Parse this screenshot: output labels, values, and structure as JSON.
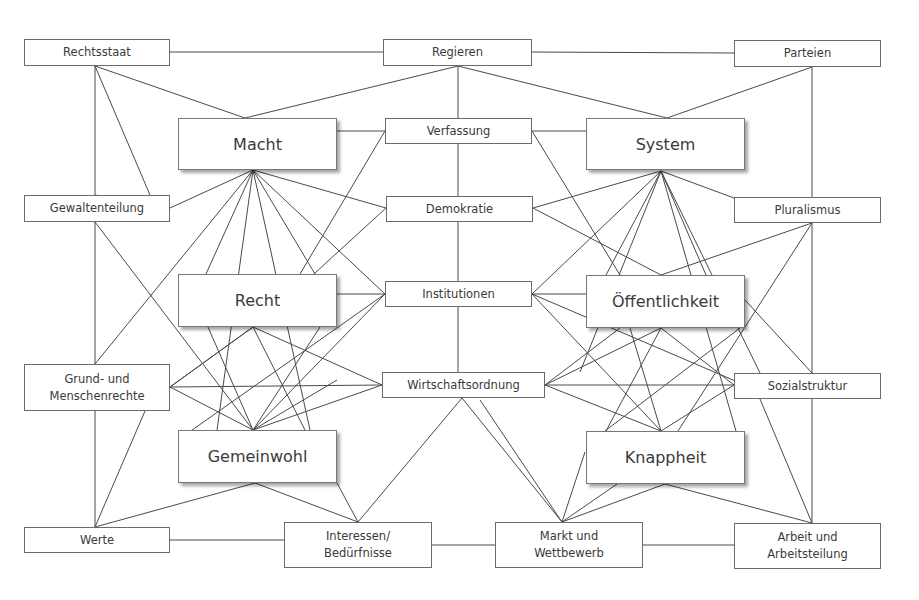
{
  "diagram": {
    "type": "concept-map",
    "nodes": [
      {
        "id": "rechtsstaat",
        "label": "Rechtsstaat",
        "kind": "small",
        "x": 24,
        "y": 39,
        "w": 146,
        "h": 27
      },
      {
        "id": "regieren",
        "label": "Regieren",
        "kind": "small",
        "x": 383,
        "y": 39,
        "w": 149,
        "h": 27
      },
      {
        "id": "parteien",
        "label": "Parteien",
        "kind": "small",
        "x": 734,
        "y": 40,
        "w": 147,
        "h": 27
      },
      {
        "id": "macht",
        "label": "Macht",
        "kind": "major",
        "x": 178,
        "y": 118,
        "w": 159,
        "h": 52
      },
      {
        "id": "verfassung",
        "label": "Verfassung",
        "kind": "small",
        "x": 385,
        "y": 118,
        "w": 147,
        "h": 26
      },
      {
        "id": "system",
        "label": "System",
        "kind": "major",
        "x": 586,
        "y": 118,
        "w": 159,
        "h": 52
      },
      {
        "id": "gewaltenteilung",
        "label": "Gewaltenteilung",
        "kind": "small",
        "x": 24,
        "y": 195,
        "w": 146,
        "h": 27
      },
      {
        "id": "demokratie",
        "label": "Demokratie",
        "kind": "small",
        "x": 386,
        "y": 196,
        "w": 147,
        "h": 26
      },
      {
        "id": "pluralismus",
        "label": "Pluralismus",
        "kind": "small",
        "x": 734,
        "y": 197,
        "w": 147,
        "h": 26
      },
      {
        "id": "recht",
        "label": "Recht",
        "kind": "major",
        "x": 178,
        "y": 274,
        "w": 159,
        "h": 53
      },
      {
        "id": "institutionen",
        "label": "Institutionen",
        "kind": "small",
        "x": 385,
        "y": 281,
        "w": 147,
        "h": 26
      },
      {
        "id": "oeffentlichkeit",
        "label": "Öffentlichkeit",
        "kind": "major",
        "x": 586,
        "y": 275,
        "w": 159,
        "h": 53
      },
      {
        "id": "grundrechte",
        "label": "Grund- und\nMenschenrechte",
        "kind": "small",
        "x": 24,
        "y": 364,
        "w": 146,
        "h": 47
      },
      {
        "id": "wirtschaftsordnung",
        "label": "Wirtschaftsordnung",
        "kind": "small",
        "x": 382,
        "y": 372,
        "w": 163,
        "h": 26
      },
      {
        "id": "sozialstruktur",
        "label": "Sozialstruktur",
        "kind": "small",
        "x": 734,
        "y": 373,
        "w": 147,
        "h": 26
      },
      {
        "id": "gemeinwohl",
        "label": "Gemeinwohl",
        "kind": "major",
        "x": 178,
        "y": 430,
        "w": 159,
        "h": 53
      },
      {
        "id": "knappheit",
        "label": "Knappheit",
        "kind": "major",
        "x": 586,
        "y": 431,
        "w": 159,
        "h": 53
      },
      {
        "id": "werte",
        "label": "Werte",
        "kind": "small",
        "x": 24,
        "y": 527,
        "w": 146,
        "h": 26
      },
      {
        "id": "interessen",
        "label": "Interessen/\nBedürfnisse",
        "kind": "small",
        "x": 284,
        "y": 522,
        "w": 148,
        "h": 46
      },
      {
        "id": "markt",
        "label": "Markt und\nWettbewerb",
        "kind": "small",
        "x": 495,
        "y": 522,
        "w": 148,
        "h": 46
      },
      {
        "id": "arbeit",
        "label": "Arbeit und\nArbeitsteilung",
        "kind": "small",
        "x": 734,
        "y": 523,
        "w": 147,
        "h": 46
      }
    ],
    "edges": [
      [
        170,
        52,
        383,
        52
      ],
      [
        532,
        52,
        734,
        53
      ],
      [
        95,
        66,
        95,
        195
      ],
      [
        95,
        66,
        150,
        195
      ],
      [
        95,
        66,
        245,
        118
      ],
      [
        458,
        66,
        245,
        118
      ],
      [
        458,
        66,
        667,
        118
      ],
      [
        458,
        66,
        458,
        118
      ],
      [
        812,
        67,
        667,
        118
      ],
      [
        812,
        67,
        812,
        197
      ],
      [
        337,
        131,
        385,
        131
      ],
      [
        532,
        131,
        586,
        131
      ],
      [
        458,
        144,
        458,
        196
      ],
      [
        385,
        131,
        300,
        274
      ],
      [
        532,
        131,
        620,
        275
      ],
      [
        253,
        170,
        170,
        208
      ],
      [
        253,
        170,
        95,
        364
      ],
      [
        253,
        170,
        206,
        274
      ],
      [
        253,
        170,
        315,
        274
      ],
      [
        253,
        170,
        386,
        208
      ],
      [
        253,
        170,
        385,
        294
      ],
      [
        253,
        170,
        217,
        430
      ],
      [
        253,
        170,
        310,
        430
      ],
      [
        661,
        171,
        533,
        208
      ],
      [
        661,
        171,
        532,
        294
      ],
      [
        661,
        171,
        606,
        275
      ],
      [
        661,
        171,
        706,
        275
      ],
      [
        661,
        171,
        734,
        198
      ],
      [
        661,
        171,
        760,
        373
      ],
      [
        661,
        171,
        580,
        372
      ],
      [
        661,
        171,
        736,
        431
      ],
      [
        170,
        208,
        95,
        195
      ],
      [
        95,
        222,
        95,
        364
      ],
      [
        95,
        222,
        253,
        430
      ],
      [
        533,
        208,
        661,
        275
      ],
      [
        386,
        208,
        256,
        327
      ],
      [
        812,
        223,
        661,
        275
      ],
      [
        812,
        223,
        812,
        373
      ],
      [
        812,
        223,
        678,
        431
      ],
      [
        458,
        222,
        458,
        281
      ],
      [
        337,
        294,
        385,
        294
      ],
      [
        532,
        294,
        586,
        294
      ],
      [
        458,
        307,
        458,
        372
      ],
      [
        385,
        294,
        178,
        440
      ],
      [
        385,
        294,
        253,
        430
      ],
      [
        532,
        294,
        661,
        431
      ],
      [
        532,
        294,
        740,
        383
      ],
      [
        253,
        327,
        170,
        387
      ],
      [
        253,
        327,
        382,
        385
      ],
      [
        253,
        327,
        310,
        440
      ],
      [
        208,
        327,
        253,
        430
      ],
      [
        320,
        327,
        253,
        430
      ],
      [
        337,
        380,
        253,
        430
      ],
      [
        170,
        387,
        382,
        385
      ],
      [
        170,
        387,
        253,
        430
      ],
      [
        170,
        387,
        253,
        327
      ],
      [
        382,
        385,
        253,
        430
      ],
      [
        545,
        385,
        734,
        385
      ],
      [
        545,
        385,
        661,
        328
      ],
      [
        545,
        385,
        661,
        431
      ],
      [
        545,
        385,
        620,
        328
      ],
      [
        661,
        328,
        734,
        385
      ],
      [
        661,
        328,
        606,
        431
      ],
      [
        734,
        385,
        661,
        431
      ],
      [
        745,
        300,
        812,
        373
      ],
      [
        630,
        328,
        661,
        431
      ],
      [
        740,
        328,
        605,
        431
      ],
      [
        95,
        411,
        95,
        527
      ],
      [
        145,
        411,
        95,
        527
      ],
      [
        255,
        483,
        95,
        527
      ],
      [
        255,
        483,
        358,
        522
      ],
      [
        337,
        483,
        358,
        522
      ],
      [
        170,
        540,
        284,
        540
      ],
      [
        432,
        545,
        495,
        545
      ],
      [
        643,
        545,
        734,
        545
      ],
      [
        462,
        398,
        358,
        522
      ],
      [
        462,
        398,
        562,
        522
      ],
      [
        617,
        484,
        562,
        522
      ],
      [
        665,
        484,
        562,
        522
      ],
      [
        665,
        484,
        812,
        523
      ],
      [
        760,
        399,
        812,
        523
      ],
      [
        812,
        399,
        812,
        523
      ],
      [
        480,
        400,
        562,
        522
      ],
      [
        585,
        452,
        562,
        522
      ]
    ]
  }
}
